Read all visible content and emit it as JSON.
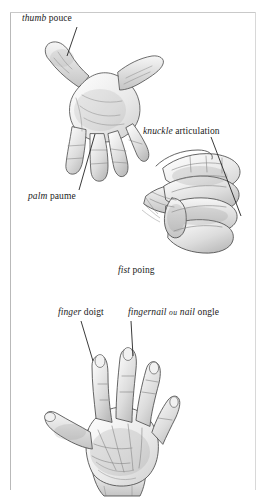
{
  "plate": {
    "title": "Hand anatomy plate",
    "language_pair": "English / French",
    "background_color": "#ffffff",
    "frame_color": "#b9b9b9",
    "ink_color": "#242424"
  },
  "labels": [
    {
      "id": "thumb",
      "english": "thumb",
      "french": "pouce",
      "conjunction": "",
      "alt_english": "",
      "alt_french": "",
      "x": 22,
      "y": 14,
      "leader": {
        "x1": 77,
        "y1": 27,
        "x2": 67,
        "y2": 56
      }
    },
    {
      "id": "palm",
      "english": "palm",
      "french": "paume",
      "conjunction": "",
      "alt_english": "",
      "alt_french": "",
      "x": 28,
      "y": 192,
      "leader": {
        "x1": 79,
        "y1": 190,
        "x2": 95,
        "y2": 134
      }
    },
    {
      "id": "knuckle",
      "english": "knuckle",
      "french": "articulation",
      "conjunction": "",
      "alt_english": "",
      "alt_french": "",
      "x": 143,
      "y": 127,
      "leader": {
        "x1": 211,
        "y1": 137,
        "x2": 241,
        "y2": 216
      }
    },
    {
      "id": "fist",
      "english": "fist",
      "french": "poing",
      "conjunction": "",
      "alt_english": "",
      "alt_french": "",
      "x": 118,
      "y": 266,
      "leader": null
    },
    {
      "id": "finger",
      "english": "finger",
      "french": "doigt",
      "conjunction": "",
      "alt_english": "",
      "alt_french": "",
      "x": 58,
      "y": 308,
      "leader": {
        "x1": 81,
        "y1": 321,
        "x2": 93,
        "y2": 361
      }
    },
    {
      "id": "fingernail",
      "english": "fingernail",
      "french": "ongle",
      "conjunction": "ou",
      "alt_english": "nail",
      "alt_french": "",
      "x": 128,
      "y": 308,
      "leader": {
        "x1": 131,
        "y1": 321,
        "x2": 133,
        "y2": 356
      }
    }
  ],
  "illustrations": [
    {
      "id": "open-hand-palm-up",
      "caption_refs": [
        "thumb",
        "palm"
      ],
      "position": {
        "x": 24,
        "y": 40,
        "width": 132,
        "height": 155
      }
    },
    {
      "id": "clenched-fist",
      "caption_refs": [
        "knuckle",
        "fist"
      ],
      "position": {
        "x": 140,
        "y": 150,
        "width": 112,
        "height": 130
      }
    },
    {
      "id": "open-hand-back",
      "caption_refs": [
        "finger",
        "fingernail"
      ],
      "position": {
        "x": 24,
        "y": 345,
        "width": 195,
        "height": 150
      }
    }
  ]
}
